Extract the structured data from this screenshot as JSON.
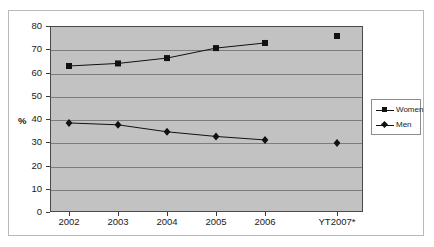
{
  "chart_data": {
    "type": "line",
    "title": "",
    "xlabel": "",
    "ylabel": "%",
    "ylim": [
      0,
      80
    ],
    "ytick_step": 10,
    "yticks": [
      "0",
      "10",
      "20",
      "30",
      "40",
      "50",
      "60",
      "70",
      "80"
    ],
    "categories": [
      "2002",
      "2003",
      "2004",
      "2005",
      "2006",
      "YT2007*"
    ],
    "grid": "horizontal",
    "legend_position": "right",
    "plot_background": "#c2c2c2",
    "gridline_color": "#7c7c7c",
    "series_color": "#111111",
    "series": [
      {
        "name": "Women",
        "marker": "square",
        "values": [
          62.8,
          63.9,
          66.2,
          70.5,
          72.7,
          75.7
        ],
        "connected": [
          true,
          true,
          true,
          true,
          true,
          false
        ]
      },
      {
        "name": "Men",
        "marker": "diamond",
        "values": [
          38.3,
          37.5,
          34.5,
          32.5,
          31.0,
          29.7
        ],
        "connected": [
          true,
          true,
          true,
          true,
          true,
          false
        ]
      }
    ]
  },
  "legend": {
    "items": [
      {
        "label": "Women",
        "marker": "square"
      },
      {
        "label": "Men",
        "marker": "diamond"
      }
    ]
  }
}
